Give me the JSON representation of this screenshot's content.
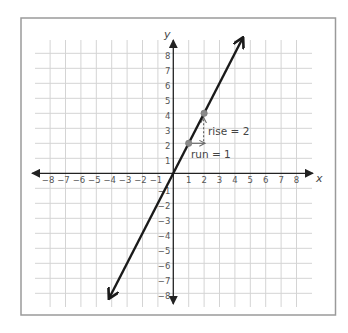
{
  "chart_data": {
    "type": "line",
    "title": "",
    "xlabel": "x",
    "ylabel": "y",
    "xlim": [
      -8,
      8
    ],
    "ylim": [
      -8,
      8
    ],
    "grid": true,
    "x_ticks": [
      -8,
      -7,
      -6,
      -5,
      -4,
      -3,
      -2,
      -1,
      1,
      2,
      3,
      4,
      5,
      6,
      7,
      8
    ],
    "y_ticks": [
      -8,
      -7,
      -6,
      -5,
      -4,
      -3,
      -2,
      -1,
      1,
      2,
      3,
      4,
      5,
      6,
      7,
      8
    ],
    "x_tick_labels": [
      "−8",
      "−7",
      "−6",
      "−5",
      "−4",
      "−3",
      "−2",
      "−1",
      "1",
      "2",
      "3",
      "4",
      "5",
      "6",
      "7",
      "8"
    ],
    "y_tick_labels": [
      "−8",
      "−7",
      "−6",
      "−5",
      "−4",
      "−3",
      "−2",
      "−1",
      "1",
      "2",
      "3",
      "4",
      "5",
      "6",
      "7",
      "8"
    ],
    "series": [
      {
        "name": "y = 2x",
        "slope": 2,
        "intercept": 0,
        "x": [
          -4.15,
          4.5
        ],
        "y": [
          -8.3,
          9.0
        ],
        "arrows_both_ends": true,
        "color": "#1a1a1a"
      }
    ],
    "points": [
      {
        "x": 1,
        "y": 2,
        "color": "#8a8a8a"
      },
      {
        "x": 2,
        "y": 4,
        "color": "#8a8a8a"
      }
    ],
    "annotations": [
      {
        "type": "run-arrow",
        "from": [
          1,
          2
        ],
        "to": [
          2,
          2
        ],
        "text": "run = 1"
      },
      {
        "type": "rise-arrow",
        "from": [
          2,
          2
        ],
        "to": [
          2,
          4
        ],
        "text": "rise = 2"
      }
    ]
  },
  "labels": {
    "x_axis": "x",
    "y_axis": "y",
    "rise": "rise = 2",
    "run": "run = 1"
  },
  "colors": {
    "grid": "#d4d4d4",
    "axis": "#222222",
    "line": "#1a1a1a",
    "frame": "#9a9a9a",
    "point": "#8a8a8a",
    "annotation": "#6a6a6a"
  }
}
